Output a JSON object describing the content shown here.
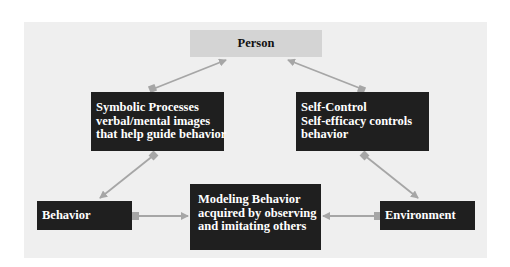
{
  "diagram": {
    "colors": {
      "panel_background": "#efefef",
      "box_dark": "#1f1f1f",
      "box_light": "#d4d4d4",
      "arrow": "#a6a6a6",
      "text_light": "#ffffff",
      "text_dark": "#111111"
    },
    "nodes": {
      "person": {
        "lines": [
          "Person"
        ]
      },
      "symbolic": {
        "lines": [
          "Symbolic Processes",
          "verbal/mental images",
          "that help guide behavior"
        ]
      },
      "selfcontrol": {
        "lines": [
          "Self-Control",
          "Self-efficacy controls",
          "behavior"
        ]
      },
      "behavior": {
        "lines": [
          "Behavior"
        ]
      },
      "modeling": {
        "lines": [
          "Modeling Behavior",
          "acquired by observing",
          "and imitating others"
        ]
      },
      "environment": {
        "lines": [
          "Environment"
        ]
      }
    },
    "edges": [
      {
        "from": "symbolic",
        "to": "person",
        "tail": "square",
        "head": "arrow"
      },
      {
        "from": "selfcontrol",
        "to": "person",
        "tail": "square",
        "head": "arrow"
      },
      {
        "from": "symbolic",
        "to": "behavior",
        "tail": "square",
        "head": "arrow"
      },
      {
        "from": "selfcontrol",
        "to": "environment",
        "tail": "square",
        "head": "arrow"
      },
      {
        "from": "behavior",
        "to": "modeling",
        "tail": "square",
        "head": "arrow"
      },
      {
        "from": "environment",
        "to": "modeling",
        "tail": "square",
        "head": "arrow"
      }
    ]
  }
}
